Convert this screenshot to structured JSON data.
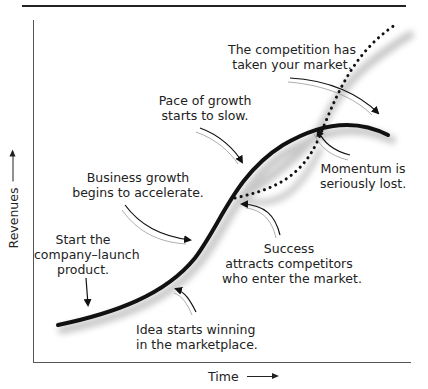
{
  "diagram": {
    "axes": {
      "y_label": "Revenues",
      "x_label": "Time",
      "y_arrow_icon": "arrow-up-icon",
      "x_arrow_icon": "arrow-right-icon"
    },
    "annotations": [
      {
        "id": "start",
        "lines": [
          "Start the",
          "company–launch",
          "product."
        ]
      },
      {
        "id": "accelerate",
        "lines": [
          "Business growth",
          "begins to accelerate."
        ]
      },
      {
        "id": "slow",
        "lines": [
          "Pace of growth",
          "starts to slow."
        ]
      },
      {
        "id": "competition",
        "lines": [
          "The competition has",
          "taken your market."
        ]
      },
      {
        "id": "momentum",
        "lines": [
          "Momentum is",
          "seriously lost."
        ]
      },
      {
        "id": "success",
        "lines": [
          "Success",
          "attracts competitors",
          "who enter the market."
        ]
      },
      {
        "id": "idea",
        "lines": [
          "Idea starts winning",
          "in the marketplace."
        ]
      }
    ],
    "series": [
      {
        "name": "Your company revenue",
        "style": "solid",
        "color": "#111111"
      },
      {
        "name": "Competitors revenue",
        "style": "dotted",
        "color": "#111111"
      }
    ],
    "shadow_color": "#c8c8c8"
  }
}
